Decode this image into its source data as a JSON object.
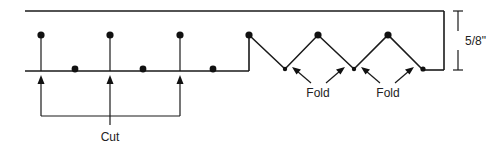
{
  "diagram": {
    "labels": {
      "cut": "Cut",
      "fold_1": "Fold",
      "fold_2": "Fold",
      "dimension": "5/8\""
    },
    "colors": {
      "stroke": "#1a1a1a",
      "dot": "#111111",
      "text": "#222222",
      "background": "#ffffff"
    },
    "elements": {
      "cut_stems": 3,
      "baseline_dots": 3,
      "zigzag_peaks": 3,
      "fold_valleys": 3,
      "fold_arrows": 4,
      "cut_arrows": 3
    }
  }
}
